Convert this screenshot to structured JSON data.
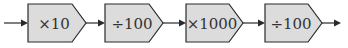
{
  "diagram": {
    "type": "function-machine-flow",
    "steps": [
      {
        "label": "×10"
      },
      {
        "label": "÷100"
      },
      {
        "label": "×1000"
      },
      {
        "label": "÷100"
      }
    ],
    "colors": {
      "box_fill": "#dcdcdc",
      "stroke": "#2a2a2a",
      "text": "#333333"
    }
  }
}
